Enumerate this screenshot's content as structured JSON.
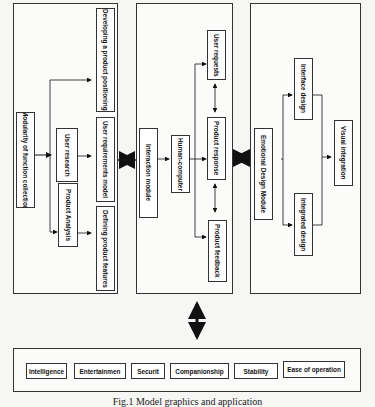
{
  "diagram": {
    "left_panel": {
      "root": "Modularity of function collection",
      "middle": [
        "User research",
        "Product Analysis"
      ],
      "outputs": [
        "Developing a product positioning",
        "User requirements model",
        "Defining product features"
      ]
    },
    "middle_panel": {
      "module": "Interaction module",
      "hub": "Human-computer",
      "outputs": [
        "User requests",
        "Product response",
        "Product feedback"
      ]
    },
    "right_panel": {
      "module": "Emotional Design Module",
      "branches": [
        "Interface design",
        "Integrated design"
      ],
      "output": "Visual integration"
    },
    "bottom_panel": {
      "attributes": [
        "Intelligence",
        "Entertainmen",
        "Securit",
        "Companionship",
        "Stability",
        "Ease of operation"
      ]
    },
    "caption": "Fig.1  Model graphics and application"
  }
}
